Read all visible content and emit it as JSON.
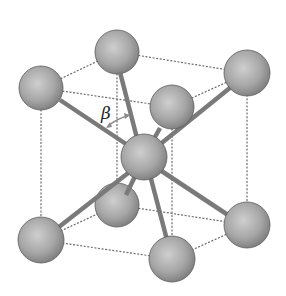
{
  "diagram": {
    "title": "",
    "type": "body-centered cubic crystal structure",
    "angle_label": "β",
    "colors": {
      "atom_light": "#c8c8c8",
      "atom_dark": "#7c7c7c",
      "bond": "#7a7a7a",
      "edge": "#6d6d6d",
      "arrow": "#8a8a8a"
    },
    "atoms": [
      {
        "id": "back-top-left",
        "x": 117,
        "y": 52,
        "r": 22
      },
      {
        "id": "left-top",
        "x": 41,
        "y": 88,
        "r": 22
      },
      {
        "id": "right-top",
        "x": 247,
        "y": 73,
        "r": 23
      },
      {
        "id": "front-top",
        "x": 172,
        "y": 107,
        "r": 22
      },
      {
        "id": "center",
        "x": 144,
        "y": 157,
        "r": 23
      },
      {
        "id": "back-bottom",
        "x": 117,
        "y": 205,
        "r": 22
      },
      {
        "id": "left-bottom",
        "x": 41,
        "y": 240,
        "r": 23
      },
      {
        "id": "right-bottom",
        "x": 247,
        "y": 225,
        "r": 23
      },
      {
        "id": "front-bottom",
        "x": 172,
        "y": 259,
        "r": 23
      }
    ]
  }
}
